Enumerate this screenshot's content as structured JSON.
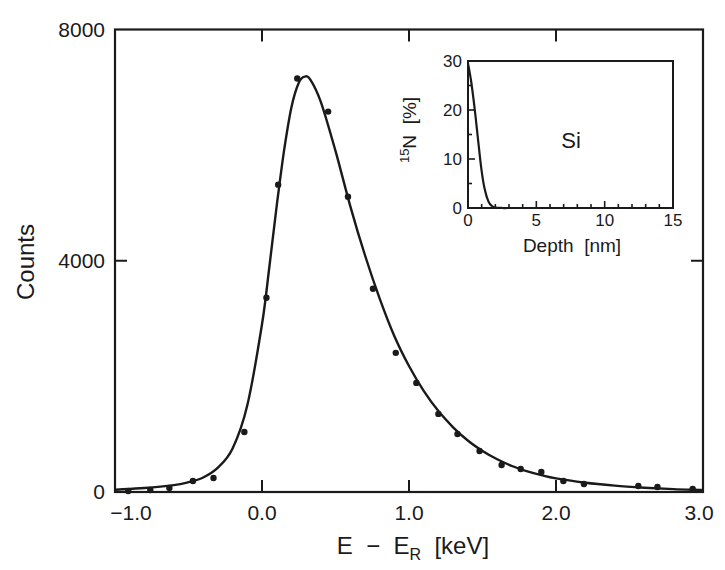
{
  "chart_data": {
    "type": "scatter",
    "title": "",
    "xlabel": "E − E_R [keV]",
    "xlabel_parts": {
      "main": "E  −  E",
      "sub": "R",
      "unit": "  [keV]"
    },
    "ylabel": "Counts",
    "xlim": [
      -1.0,
      3.0
    ],
    "ylim": [
      0,
      8000
    ],
    "x_ticks": [
      {
        "value": -1.0,
        "label": "−1.0"
      },
      {
        "value": 0.0,
        "label": "0.0"
      },
      {
        "value": 1.0,
        "label": "1.0"
      },
      {
        "value": 2.0,
        "label": "2.0"
      },
      {
        "value": 3.0,
        "label": "3.0"
      }
    ],
    "y_ticks": [
      {
        "value": 0,
        "label": "0"
      },
      {
        "value": 4000,
        "label": "4000"
      },
      {
        "value": 8000,
        "label": "8000"
      }
    ],
    "grid": false,
    "legend": null,
    "series": [
      {
        "name": "measured",
        "kind": "scatter",
        "marker": "dot",
        "x": [
          -0.91,
          -0.76,
          -0.63,
          -0.47,
          -0.33,
          -0.12,
          0.03,
          0.11,
          0.24,
          0.45,
          0.585,
          0.755,
          0.91,
          1.05,
          1.2,
          1.33,
          1.48,
          1.63,
          1.76,
          1.9,
          2.05,
          2.19,
          2.56,
          2.69,
          2.93
        ],
        "y": [
          17,
          35,
          69,
          190,
          242,
          1039,
          3359,
          5316,
          7152,
          6580,
          5108,
          3515,
          2407,
          1887,
          1351,
          1004,
          710,
          467,
          398,
          346,
          190,
          138,
          104,
          87,
          52
        ]
      },
      {
        "name": "fit",
        "kind": "line",
        "x": [
          -1.0,
          -0.8,
          -0.6,
          -0.5,
          -0.4,
          -0.3,
          -0.2,
          -0.1,
          0.0,
          0.05,
          0.1,
          0.15,
          0.2,
          0.25,
          0.29,
          0.33,
          0.4,
          0.5,
          0.6,
          0.7,
          0.8,
          0.9,
          1.0,
          1.1,
          1.2,
          1.3,
          1.4,
          1.5,
          1.6,
          1.7,
          1.8,
          1.9,
          2.0,
          2.2,
          2.4,
          2.6,
          2.8,
          3.0
        ],
        "y": [
          40,
          70,
          120,
          170,
          250,
          420,
          750,
          1500,
          2900,
          3900,
          4950,
          5900,
          6650,
          7080,
          7186,
          7130,
          6750,
          5900,
          4950,
          4100,
          3350,
          2700,
          2180,
          1750,
          1400,
          1120,
          890,
          710,
          565,
          450,
          360,
          290,
          235,
          160,
          110,
          75,
          50,
          35
        ]
      }
    ],
    "inset": {
      "type": "line",
      "xlabel": "Depth  [nm]",
      "ylabel": "¹⁵N  [%]",
      "ylabel_parts": {
        "sup": "15",
        "main": "N  [%]"
      },
      "annotation": "Si",
      "xlim": [
        0,
        15
      ],
      "ylim": [
        0,
        30
      ],
      "x_ticks": [
        {
          "value": 0,
          "label": "0"
        },
        {
          "value": 5,
          "label": "5"
        },
        {
          "value": 10,
          "label": "10"
        },
        {
          "value": 15,
          "label": "15"
        }
      ],
      "y_ticks": [
        {
          "value": 0,
          "label": "0"
        },
        {
          "value": 10,
          "label": "10"
        },
        {
          "value": 20,
          "label": "20"
        },
        {
          "value": 30,
          "label": "30"
        }
      ],
      "series": [
        {
          "name": "15N depth profile",
          "x": [
            0,
            0.1,
            0.25,
            0.5,
            0.75,
            1.0,
            1.25,
            1.5,
            1.75,
            2.0,
            2.5,
            3.0
          ],
          "y": [
            29.5,
            28,
            25.5,
            20,
            13.5,
            7.5,
            3.5,
            1.3,
            0.4,
            0.1,
            0,
            0
          ]
        }
      ]
    }
  },
  "colors": {
    "ink": "#1a1a1a",
    "background": "#ffffff"
  }
}
